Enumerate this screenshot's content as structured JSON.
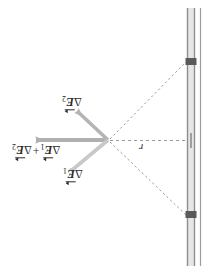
{
  "figure": {
    "name": "two-slit-field-superposition-diagram",
    "orientation_note": "content rendered rotated 180 degrees",
    "width": 213,
    "height": 272,
    "background": "#ffffff"
  },
  "labels": {
    "delta_e2": {
      "delta": "Δ",
      "symbol": "E",
      "subscript": "2"
    },
    "delta_e1": {
      "delta": "Δ",
      "symbol": "E",
      "subscript": "1"
    },
    "sum": {
      "delta": "Δ",
      "symbol": "E",
      "subscript_first": "1",
      "plus": "+",
      "delta2": "Δ",
      "symbol2": "E",
      "subscript_second": "2"
    },
    "distance": "r"
  },
  "vectors": [
    {
      "name": "delta-e1-vector",
      "label": "ΔE₁",
      "from": [
        108,
        140
      ],
      "to": [
        68,
        174
      ],
      "color": "#c8c8c8",
      "direction": "down-left"
    },
    {
      "name": "delta-e2-vector",
      "label": "ΔE₂",
      "from": [
        108,
        140
      ],
      "to": [
        74,
        108
      ],
      "color": "#b4b4b4",
      "direction": "up-left"
    },
    {
      "name": "resultant-vector",
      "label": "ΔE₁ + ΔE₂",
      "from": [
        108,
        140
      ],
      "to": [
        33,
        140
      ],
      "color": "#b0b0b0",
      "direction": "left"
    }
  ],
  "rays": [
    {
      "name": "ray-to-upper-slit",
      "from": [
        108,
        140
      ],
      "to": [
        186,
        62
      ],
      "style": "dashed",
      "color": "#9a9a9a"
    },
    {
      "name": "ray-to-lower-slit",
      "from": [
        108,
        140
      ],
      "to": [
        186,
        215
      ],
      "style": "dashed",
      "color": "#9a9a9a"
    },
    {
      "name": "axis-line-r",
      "from": [
        108,
        140
      ],
      "to": [
        186,
        140
      ],
      "style": "dashed",
      "color": "#9a9a9a"
    }
  ],
  "barrier": {
    "name": "slit-barrier",
    "x": 190,
    "top": 8,
    "bottom": 266,
    "color": "#8e8e8e",
    "fill": "#e2e2e2",
    "slits": [
      {
        "name": "upper-slit",
        "y": 62,
        "color": "#5a5a5a"
      },
      {
        "name": "lower-slit",
        "y": 215,
        "color": "#5a5a5a"
      }
    ],
    "center_tick": {
      "name": "barrier-center-tick",
      "y": 140,
      "color": "#7a7a7a"
    }
  },
  "colors": {
    "vector_light": "#c8c8c8",
    "vector_mid": "#b0b0b0",
    "dashed": "#9a9a9a",
    "barrier_edge": "#8e8e8e",
    "slit_dark": "#5a5a5a",
    "text": "#2b2b2b"
  }
}
